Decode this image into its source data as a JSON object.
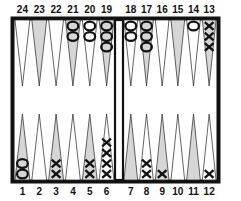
{
  "board": {
    "frame_color": "#111111",
    "light_point_color": "#ffffff",
    "dark_point_color": "#d6d6d6",
    "top_labels_left": [
      "24",
      "23",
      "22",
      "21",
      "20",
      "19"
    ],
    "top_labels_right": [
      "18",
      "17",
      "16",
      "15",
      "14",
      "13"
    ],
    "bottom_labels_left": [
      "1",
      "2",
      "3",
      "4",
      "5",
      "6"
    ],
    "bottom_labels_right": [
      "7",
      "8",
      "9",
      "10",
      "11",
      "12"
    ],
    "points": [
      {
        "point": 24,
        "shade": "light",
        "checkers": 0,
        "player": ""
      },
      {
        "point": 23,
        "shade": "dark",
        "checkers": 0,
        "player": ""
      },
      {
        "point": 22,
        "shade": "light",
        "checkers": 0,
        "player": ""
      },
      {
        "point": 21,
        "shade": "dark",
        "checkers": 2,
        "player": "O"
      },
      {
        "point": 20,
        "shade": "light",
        "checkers": 2,
        "player": "O"
      },
      {
        "point": 19,
        "shade": "dark",
        "checkers": 3,
        "player": "O"
      },
      {
        "point": 18,
        "shade": "light",
        "checkers": 2,
        "player": "O"
      },
      {
        "point": 17,
        "shade": "dark",
        "checkers": 3,
        "player": "O"
      },
      {
        "point": 16,
        "shade": "light",
        "checkers": 0,
        "player": ""
      },
      {
        "point": 15,
        "shade": "dark",
        "checkers": 0,
        "player": ""
      },
      {
        "point": 14,
        "shade": "light",
        "checkers": 1,
        "player": "O"
      },
      {
        "point": 13,
        "shade": "dark",
        "checkers": 3,
        "player": "X"
      },
      {
        "point": 1,
        "shade": "dark",
        "checkers": 2,
        "player": "O"
      },
      {
        "point": 2,
        "shade": "light",
        "checkers": 0,
        "player": ""
      },
      {
        "point": 3,
        "shade": "dark",
        "checkers": 2,
        "player": "X"
      },
      {
        "point": 4,
        "shade": "light",
        "checkers": 0,
        "player": ""
      },
      {
        "point": 5,
        "shade": "dark",
        "checkers": 2,
        "player": "X"
      },
      {
        "point": 6,
        "shade": "light",
        "checkers": 4,
        "player": "X"
      },
      {
        "point": 7,
        "shade": "dark",
        "checkers": 0,
        "player": ""
      },
      {
        "point": 8,
        "shade": "light",
        "checkers": 2,
        "player": "X"
      },
      {
        "point": 9,
        "shade": "dark",
        "checkers": 1,
        "player": "X"
      },
      {
        "point": 10,
        "shade": "light",
        "checkers": 0,
        "player": ""
      },
      {
        "point": 11,
        "shade": "dark",
        "checkers": 0,
        "player": ""
      },
      {
        "point": 12,
        "shade": "light",
        "checkers": 1,
        "player": "X"
      }
    ]
  }
}
